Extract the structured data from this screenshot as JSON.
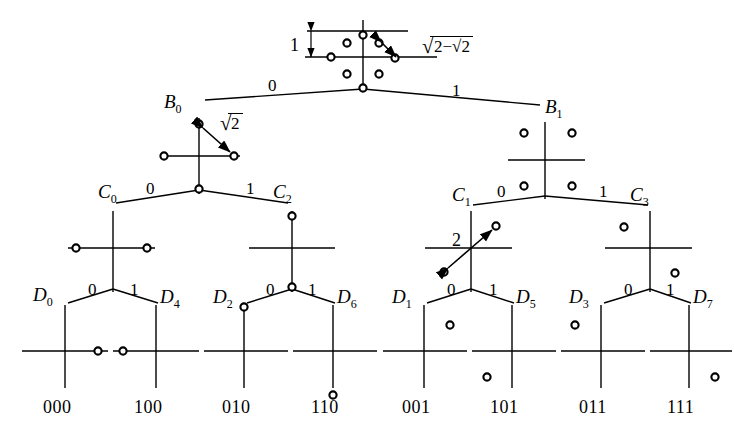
{
  "figure": {
    "type": "set-partitioning-tree",
    "levels": [
      {
        "name": "root",
        "nodes": [
          {
            "id": "A0",
            "label": "",
            "x": 363,
            "y": 55,
            "distance_label": "sqrt(2-sqrt2)",
            "vertical_measure_label": "1",
            "points": [
              {
                "x": 0,
                "y": -22
              },
              {
                "x": 15,
                "y": -15
              },
              {
                "x": 22,
                "y": 0
              },
              {
                "x": 15,
                "y": 15
              },
              {
                "x": 0,
                "y": 22
              },
              {
                "x": -15,
                "y": 15
              },
              {
                "x": -22,
                "y": 0
              },
              {
                "x": -15,
                "y": -15
              }
            ]
          }
        ]
      },
      {
        "name": "B",
        "nodes": [
          {
            "id": "B0",
            "label": "B",
            "sub": "0",
            "x": 199,
            "y": 152,
            "distance_label": "sqrt2",
            "points": [
              {
                "x": 0,
                "y": -22
              },
              {
                "x": 22,
                "y": 0
              },
              {
                "x": 0,
                "y": 22
              },
              {
                "x": -22,
                "y": 0
              }
            ]
          },
          {
            "id": "B1",
            "label": "B",
            "sub": "1",
            "x": 545,
            "y": 157,
            "distance_label": "",
            "points": [
              {
                "x": -19,
                "y": -19
              },
              {
                "x": 19,
                "y": -19
              },
              {
                "x": -19,
                "y": 19
              },
              {
                "x": 19,
                "y": 19
              }
            ]
          }
        ]
      },
      {
        "name": "C",
        "nodes": [
          {
            "id": "C0",
            "label": "C",
            "sub": "0",
            "x": 113,
            "y": 247,
            "distance_label": "",
            "points": [
              {
                "x": -32,
                "y": 0
              },
              {
                "x": 32,
                "y": 0
              }
            ]
          },
          {
            "id": "C2",
            "label": "C",
            "sub": "2",
            "x": 292,
            "y": 247,
            "distance_label": "",
            "points": [
              {
                "x": 0,
                "y": -28
              },
              {
                "x": 0,
                "y": 28
              }
            ]
          },
          {
            "id": "C1",
            "label": "C",
            "sub": "1",
            "x": 471,
            "y": 247,
            "distance_label": "2",
            "points": [
              {
                "x": 24,
                "y": -24
              },
              {
                "x": -24,
                "y": 24
              }
            ]
          },
          {
            "id": "C3",
            "label": "C",
            "sub": "3",
            "x": 650,
            "y": 247,
            "distance_label": "",
            "points": [
              {
                "x": -24,
                "y": -24
              },
              {
                "x": 24,
                "y": 24
              }
            ]
          }
        ]
      },
      {
        "name": "D",
        "nodes": [
          {
            "id": "D0",
            "label": "D",
            "sub": "0",
            "x": 65,
            "y": 345,
            "code": "000",
            "points": [
              {
                "x": 33,
                "y": 0
              }
            ]
          },
          {
            "id": "D4",
            "label": "D",
            "sub": "4",
            "x": 156,
            "y": 345,
            "code": "100",
            "points": [
              {
                "x": -33,
                "y": 0
              }
            ]
          },
          {
            "id": "D2",
            "label": "D",
            "sub": "2",
            "x": 244,
            "y": 345,
            "code": "010",
            "points": [
              {
                "x": 0,
                "y": -44
              }
            ]
          },
          {
            "id": "D6",
            "label": "D",
            "sub": "6",
            "x": 333,
            "y": 345,
            "code": "110",
            "points": [
              {
                "x": 0,
                "y": 44
              }
            ]
          },
          {
            "id": "D1",
            "label": "D",
            "sub": "1",
            "x": 424,
            "y": 345,
            "code": "001",
            "points": [
              {
                "x": 26,
                "y": -26
              }
            ]
          },
          {
            "id": "D5",
            "label": "D",
            "sub": "5",
            "x": 512,
            "y": 345,
            "code": "101",
            "points": [
              {
                "x": -26,
                "y": 26
              }
            ]
          },
          {
            "id": "D3",
            "label": "D",
            "sub": "3",
            "x": 601,
            "y": 345,
            "code": "011",
            "points": [
              {
                "x": -26,
                "y": -26
              }
            ]
          },
          {
            "id": "D7",
            "label": "D",
            "sub": "7",
            "x": 689,
            "y": 345,
            "code": "111",
            "points": [
              {
                "x": 26,
                "y": 26
              }
            ]
          }
        ]
      }
    ],
    "branch_labels": {
      "root_to_B0": "0",
      "root_to_B1": "1",
      "B0_to_C0": "0",
      "B0_to_C2": "1",
      "B1_to_C1": "0",
      "B1_to_C3": "1",
      "C0_to_D0": "0",
      "C0_to_D4": "1",
      "C2_to_D2": "0",
      "C2_to_D6": "1",
      "C1_to_D1": "0",
      "C1_to_D5": "1",
      "C3_to_D3": "0",
      "C3_to_D7": "1"
    },
    "node_labels": {
      "B0": "B",
      "B0_sub": "0",
      "B1": "B",
      "B1_sub": "1",
      "C0": "C",
      "C0_sub": "0",
      "C1": "C",
      "C1_sub": "1",
      "C2": "C",
      "C2_sub": "2",
      "C3": "C",
      "C3_sub": "3",
      "D0": "D",
      "D0_sub": "0",
      "D1": "D",
      "D1_sub": "1",
      "D2": "D",
      "D2_sub": "2",
      "D3": "D",
      "D3_sub": "3",
      "D4": "D",
      "D4_sub": "4",
      "D5": "D",
      "D5_sub": "5",
      "D6": "D",
      "D6_sub": "6",
      "D7": "D",
      "D7_sub": "7"
    },
    "leaf_codes": {
      "D0": "000",
      "D4": "100",
      "D2": "010",
      "D6": "110",
      "D1": "001",
      "D5": "101",
      "D3": "011",
      "D7": "111"
    },
    "distance_labels": {
      "root_vertical": "1",
      "root_distance_radicand": "2−√2",
      "B0_distance_radicand": "2",
      "C1_distance": "2"
    },
    "colors": {
      "line": "#000000",
      "background": "#ffffff",
      "point_fill": "#ffffff",
      "point_stroke": "#000000"
    }
  }
}
